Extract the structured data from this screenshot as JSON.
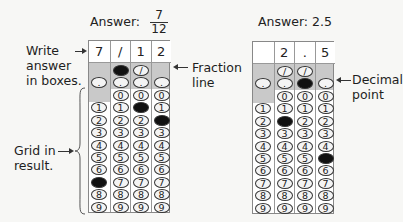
{
  "example1": {
    "answer_label": "Answer:",
    "answer_numerator": "7",
    "answer_denominator": "12",
    "written": [
      "7",
      "/",
      "1",
      "2"
    ],
    "filled": {
      "slash_col": 1,
      "digits": [
        7,
        null,
        1,
        2
      ]
    },
    "labels": {
      "write": [
        "Write",
        "answer",
        "in boxes."
      ],
      "fraction": [
        "Fraction",
        "line"
      ],
      "grid": [
        "Grid in",
        "result."
      ]
    }
  },
  "example2": {
    "answer_label": "Answer: 2.5",
    "written": [
      "",
      "2",
      ".",
      "5"
    ],
    "filled": {
      "decimal_col": 2,
      "digits": [
        null,
        2,
        null,
        5
      ]
    },
    "labels": {
      "decimal": [
        "Decimal",
        "point"
      ]
    }
  },
  "bubbles": {
    "slash": "/",
    "dot": ".",
    "digits": [
      "0",
      "1",
      "2",
      "3",
      "4",
      "5",
      "6",
      "7",
      "8",
      "9"
    ]
  },
  "colors": {
    "fill": "#111111",
    "band": "#c9c9c9",
    "background": "#f7f7f5"
  }
}
